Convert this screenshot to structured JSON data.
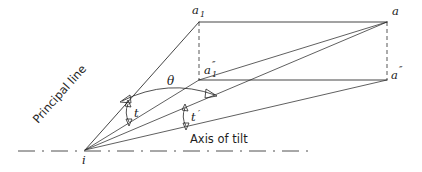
{
  "figure": {
    "kind": "geometry-diagram",
    "background_color": "#ffffff",
    "line_color": "#242424",
    "text_color": "#1a1a1a"
  },
  "labels": {
    "a1": "a",
    "a1_sub": "1",
    "a": "a",
    "a1dprime_base": "a",
    "a1dprime_sub": "1",
    "a1dprime_prime": "″",
    "adprime": "a",
    "adprime_prime": "″",
    "i": "i",
    "theta": "θ",
    "t": "t",
    "t_prime_base": "t",
    "t_prime_mark": "′",
    "principal_line": "Principal line",
    "axis_of_tilt": "Axis of tilt"
  },
  "geometry": {
    "points": {
      "i": {
        "x": 85,
        "y": 150
      },
      "a1": {
        "x": 199,
        "y": 22
      },
      "a": {
        "x": 387,
        "y": 22
      },
      "a1dprime": {
        "x": 199,
        "y": 80
      },
      "adprime": {
        "x": 387,
        "y": 80
      }
    },
    "rays_from_i": [
      "a1",
      "a1dprime",
      "a",
      "adprime"
    ],
    "rectangle_edges": [
      "a1-a",
      "a1dprime-adprime"
    ],
    "dashed_edges": [
      "a1-a1dprime",
      "a-adprime"
    ],
    "diagonal": "a1dprime-a",
    "axis_line": {
      "x1": 18,
      "x2": 312,
      "y": 151
    },
    "angles": {
      "theta": {
        "between": [
          "principal-line",
          "ray-i-a1dprime"
        ],
        "vertex": "i"
      },
      "t": {
        "between": [
          "ray-i-a1",
          "ray-i-a"
        ],
        "vertex": "i"
      },
      "t_prime": {
        "between": [
          "ray-i-a1dprime",
          "ray-i-adprime"
        ],
        "vertex": "i"
      }
    }
  },
  "label_positions": {
    "a1": {
      "x": 192,
      "y": 14
    },
    "a": {
      "x": 392,
      "y": 15
    },
    "a1dprime": {
      "x": 205,
      "y": 74
    },
    "adprime": {
      "x": 392,
      "y": 78
    },
    "i": {
      "x": 82,
      "y": 164
    },
    "theta": {
      "x": 167,
      "y": 84
    },
    "t": {
      "x": 131,
      "y": 114
    },
    "t_prime": {
      "x": 188,
      "y": 118
    },
    "principal_line": {
      "x": 38,
      "y": 118,
      "rotation": -48
    },
    "axis_of_tilt": {
      "x": 190,
      "y": 143
    }
  }
}
